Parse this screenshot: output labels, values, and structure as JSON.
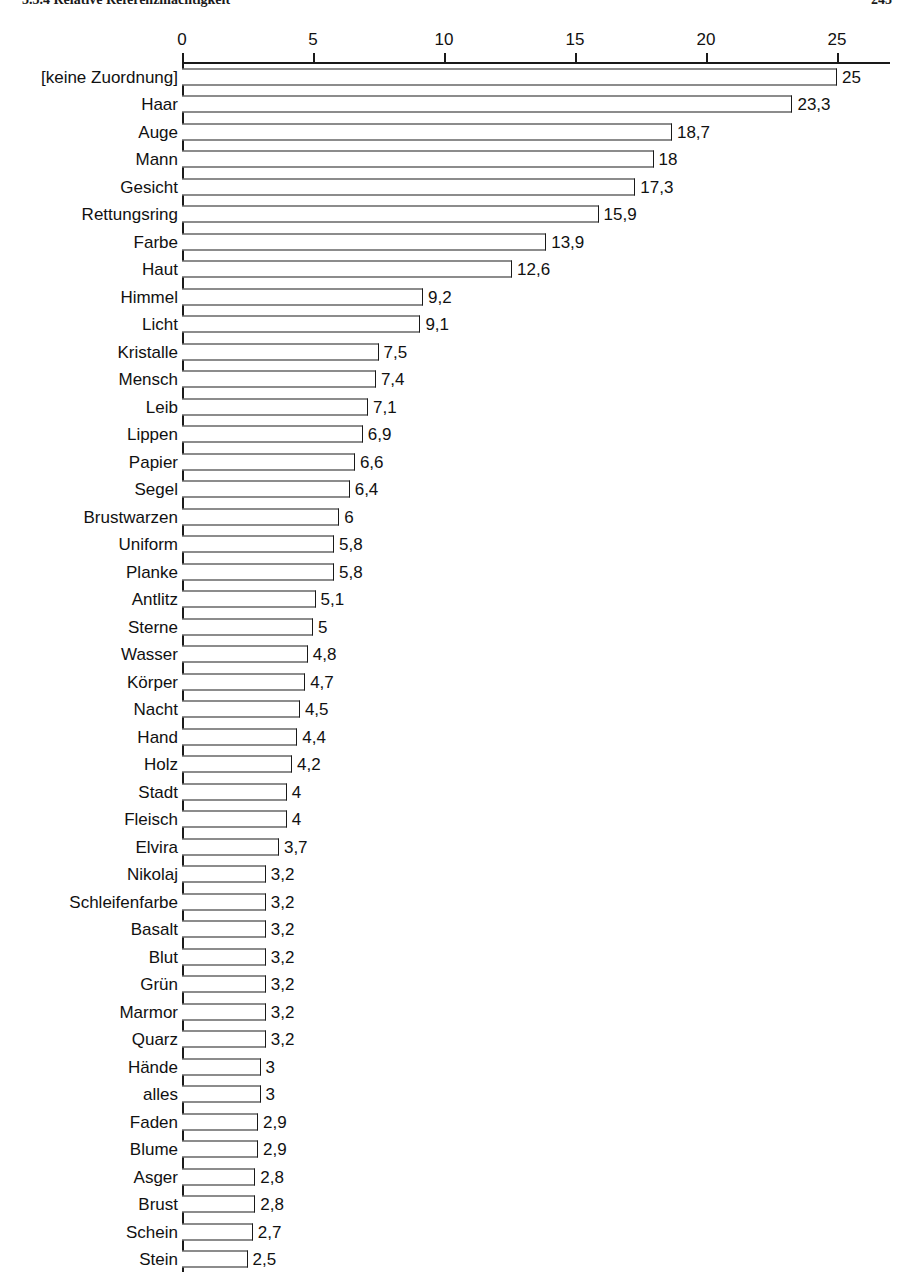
{
  "running_head": {
    "left": "3.3.4 Relative Referenzmächtigkeit",
    "right": "245"
  },
  "chart_data": {
    "type": "bar",
    "orientation": "horizontal",
    "title": "",
    "subtitle": "",
    "xlabel": "",
    "ylabel": "",
    "xlim": [
      0,
      27
    ],
    "axis_ticks": [
      0,
      5,
      10,
      15,
      20,
      25
    ],
    "tick_labels": [
      "0",
      "5",
      "10",
      "15",
      "20",
      "25"
    ],
    "grid": false,
    "legend": null,
    "decimal_separator": ",",
    "categories": [
      "[keine Zuordnung]",
      "Haar",
      "Auge",
      "Mann",
      "Gesicht",
      "Rettungsring",
      "Farbe",
      "Haut",
      "Himmel",
      "Licht",
      "Kristalle",
      "Mensch",
      "Leib",
      "Lippen",
      "Papier",
      "Segel",
      "Brustwarzen",
      "Uniform",
      "Planke",
      "Antlitz",
      "Sterne",
      "Wasser",
      "Körper",
      "Nacht",
      "Hand",
      "Holz",
      "Stadt",
      "Fleisch",
      "Elvira",
      "Nikolaj",
      "Schleifenfarbe",
      "Basalt",
      "Blut",
      "Grün",
      "Marmor",
      "Quarz",
      "Hände",
      "alles",
      "Faden",
      "Blume",
      "Asger",
      "Brust",
      "Schein",
      "Stein"
    ],
    "values": [
      25,
      23.3,
      18.7,
      18,
      17.3,
      15.9,
      13.9,
      12.6,
      9.2,
      9.1,
      7.5,
      7.4,
      7.1,
      6.9,
      6.6,
      6.4,
      6,
      5.8,
      5.8,
      5.1,
      5,
      4.8,
      4.7,
      4.5,
      4.4,
      4.2,
      4,
      4,
      3.7,
      3.2,
      3.2,
      3.2,
      3.2,
      3.2,
      3.2,
      3.2,
      3,
      3,
      2.9,
      2.9,
      2.8,
      2.8,
      2.7,
      2.5
    ],
    "value_labels": [
      "25",
      "23,3",
      "18,7",
      "18",
      "17,3",
      "15,9",
      "13,9",
      "12,6",
      "9,2",
      "9,1",
      "7,5",
      "7,4",
      "7,1",
      "6,9",
      "6,6",
      "6,4",
      "6",
      "5,8",
      "5,8",
      "5,1",
      "5",
      "4,8",
      "4,7",
      "4,5",
      "4,4",
      "4,2",
      "4",
      "4",
      "3,7",
      "3,2",
      "3,2",
      "3,2",
      "3,2",
      "3,2",
      "3,2",
      "3,2",
      "3",
      "3",
      "2,9",
      "2,9",
      "2,8",
      "2,8",
      "2,7",
      "2,5"
    ],
    "colors": {
      "bar_fill": "#ffffff",
      "bar_stroke": "#1a1a1a",
      "axis": "#1a1a1a",
      "text": "#111111",
      "background": "#ffffff"
    }
  }
}
